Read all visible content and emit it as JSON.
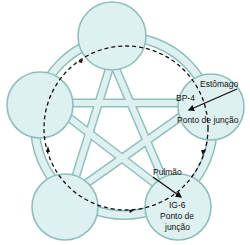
{
  "diagram": {
    "type": "five-element-cycle",
    "colors": {
      "node_fill": "#dff0f1",
      "node_stroke": "#8fbfbd",
      "band_fill": "#dff0f1",
      "dashed_line": "#111111",
      "text": "#111111"
    },
    "nodes": [
      {
        "id": "top",
        "label": ""
      },
      {
        "id": "right",
        "label": ""
      },
      {
        "id": "bottom-right",
        "label": ""
      },
      {
        "id": "bottom-left",
        "label": ""
      },
      {
        "id": "left",
        "label": ""
      }
    ],
    "labels": {
      "stomach": "Estômago",
      "bp4": "BP-4",
      "junction_right": "Ponto de junção",
      "lung": "Pulmão",
      "ig6": "IG-6",
      "junction_bottom_1": "Ponto de",
      "junction_bottom_2": "junção"
    }
  }
}
